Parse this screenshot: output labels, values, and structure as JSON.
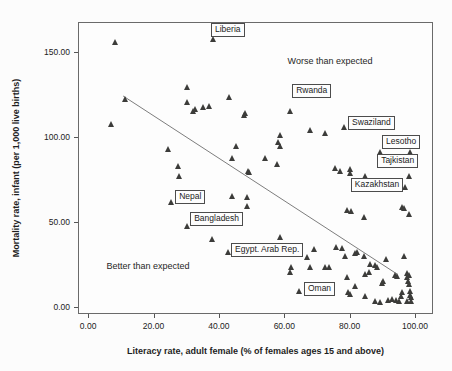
{
  "chart_data": {
    "type": "scatter",
    "title": "",
    "xlabel": "Literacy rate, adult female (% of females ages 15 and above)",
    "ylabel": "Mortality rate, infant (per 1,000 live births)",
    "x_ticks": [
      0,
      20,
      40,
      60,
      80,
      100
    ],
    "y_ticks": [
      0,
      50,
      100,
      150
    ],
    "tick_decimals": 2,
    "xlim": [
      -3.1,
      105.5
    ],
    "ylim": [
      -4.1,
      167.6
    ],
    "grid": false,
    "legend": "none",
    "marker": "triangle-up",
    "marker_color": "#3c3c3a",
    "frame_color": "#6a6a6a",
    "regression_line": {
      "x1": 10.7,
      "y1": 124.1,
      "x2": 94.5,
      "y2": 19.4,
      "color": "#7d7d7d"
    },
    "annotations": [
      {
        "text": "Worse than expected",
        "x": 74.0,
        "y": 144.7
      },
      {
        "text": "Better than expected",
        "x": 18.3,
        "y": 24.1
      }
    ],
    "labeled_points": [
      {
        "label": "Liberia",
        "x": 38.2,
        "y": 157.1,
        "box_dx": -2,
        "box_dy": -17
      },
      {
        "label": "Rwanda",
        "x": 61.8,
        "y": 114.7,
        "box_dx": 2,
        "box_dy": -28
      },
      {
        "label": "Swaziland",
        "x": 78.3,
        "y": 105.3,
        "box_dx": 4,
        "box_dy": -12
      },
      {
        "label": "Lesotho",
        "x": 89.3,
        "y": 90.6,
        "box_dx": 2,
        "box_dy": -18
      },
      {
        "label": "Tajkistan",
        "x": 98.2,
        "y": 76.5,
        "box_dx": -32,
        "box_dy": -23
      },
      {
        "label": "Kazakhstan",
        "x": 97.2,
        "y": 70.0,
        "box_dx": -55,
        "box_dy": -10
      },
      {
        "label": "Nepal",
        "x": 25.4,
        "y": 61.2,
        "box_dx": 4,
        "box_dy": -13
      },
      {
        "label": "Bangladesh",
        "x": 30.3,
        "y": 47.1,
        "box_dx": 3,
        "box_dy": -15
      },
      {
        "label": "Egypt. Arab Rep.",
        "x": 42.8,
        "y": 31.8,
        "box_dx": 3,
        "box_dy": -10
      },
      {
        "label": "Oman",
        "x": 64.8,
        "y": 8.8,
        "box_dx": 4,
        "box_dy": -10
      }
    ],
    "points": [
      [
        8.3,
        155.3
      ],
      [
        11.3,
        121.8
      ],
      [
        7.3,
        107.1
      ],
      [
        24.5,
        92.4
      ],
      [
        27.5,
        82.4
      ],
      [
        28.1,
        76.5
      ],
      [
        30.3,
        128.8
      ],
      [
        30.3,
        120.0
      ],
      [
        32.7,
        115.9
      ],
      [
        32.1,
        114.7
      ],
      [
        35.2,
        117.1
      ],
      [
        37.0,
        117.6
      ],
      [
        43.1,
        122.9
      ],
      [
        48.0,
        113.5
      ],
      [
        38.2,
        157.1
      ],
      [
        47.7,
        112.4
      ],
      [
        44.3,
        87.1
      ],
      [
        54.4,
        87.1
      ],
      [
        57.8,
        83.5
      ],
      [
        49.2,
        79.4
      ],
      [
        61.8,
        114.7
      ],
      [
        58.7,
        100.6
      ],
      [
        58.1,
        96.5
      ],
      [
        59.0,
        94.1
      ],
      [
        67.9,
        103.5
      ],
      [
        72.5,
        102.0
      ],
      [
        78.3,
        105.3
      ],
      [
        45.3,
        94.1
      ],
      [
        44.3,
        64.7
      ],
      [
        48.6,
        64.1
      ],
      [
        48.6,
        58.8
      ],
      [
        25.4,
        61.2
      ],
      [
        30.3,
        47.1
      ],
      [
        37.9,
        39.4
      ],
      [
        58.7,
        40.6
      ],
      [
        42.8,
        31.8
      ],
      [
        64.2,
        34.7
      ],
      [
        67.0,
        28.8
      ],
      [
        62.1,
        22.9
      ],
      [
        67.9,
        22.9
      ],
      [
        72.5,
        22.9
      ],
      [
        61.8,
        20.0
      ],
      [
        64.8,
        8.8
      ],
      [
        75.8,
        81.2
      ],
      [
        77.1,
        79.4
      ],
      [
        80.4,
        80.6
      ],
      [
        80.4,
        78.2
      ],
      [
        84.7,
        76.5
      ],
      [
        98.2,
        76.5
      ],
      [
        89.3,
        90.6
      ],
      [
        98.5,
        90.6
      ],
      [
        97.2,
        70.0
      ],
      [
        79.2,
        56.5
      ],
      [
        80.7,
        55.9
      ],
      [
        84.4,
        52.4
      ],
      [
        96.3,
        58.2
      ],
      [
        96.9,
        57.6
      ],
      [
        98.2,
        54.1
      ],
      [
        49.5,
        78.8
      ],
      [
        69.4,
        33.5
      ],
      [
        73.7,
        22.9
      ],
      [
        76.1,
        34.7
      ],
      [
        77.7,
        34.1
      ],
      [
        78.6,
        29.4
      ],
      [
        79.2,
        17.1
      ],
      [
        79.8,
        8.2
      ],
      [
        80.4,
        7.1
      ],
      [
        81.7,
        31.2
      ],
      [
        82.3,
        31.8
      ],
      [
        81.7,
        11.8
      ],
      [
        84.4,
        29.4
      ],
      [
        84.7,
        18.8
      ],
      [
        84.7,
        5.9
      ],
      [
        86.2,
        20.0
      ],
      [
        86.5,
        24.7
      ],
      [
        87.8,
        24.1
      ],
      [
        88.4,
        22.9
      ],
      [
        87.8,
        2.9
      ],
      [
        89.3,
        2.4
      ],
      [
        90.5,
        14.7
      ],
      [
        90.2,
        13.5
      ],
      [
        91.4,
        27.6
      ],
      [
        92.0,
        3.5
      ],
      [
        93.0,
        4.1
      ],
      [
        93.9,
        18.2
      ],
      [
        94.5,
        17.6
      ],
      [
        94.2,
        3.5
      ],
      [
        95.1,
        2.9
      ],
      [
        96.0,
        5.9
      ],
      [
        96.3,
        8.2
      ],
      [
        96.9,
        29.4
      ],
      [
        97.6,
        19.4
      ],
      [
        97.6,
        17.1
      ],
      [
        98.2,
        18.2
      ],
      [
        97.9,
        14.7
      ],
      [
        98.2,
        12.9
      ],
      [
        98.5,
        8.8
      ],
      [
        98.5,
        6.5
      ],
      [
        98.8,
        5.3
      ],
      [
        98.8,
        2.9
      ],
      [
        97.6,
        2.9
      ]
    ]
  }
}
